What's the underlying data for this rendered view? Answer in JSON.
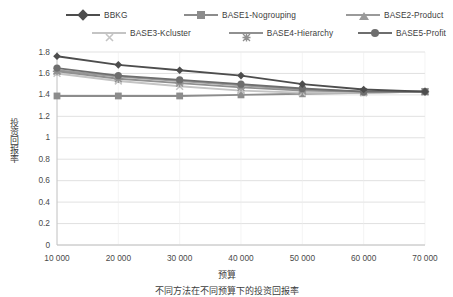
{
  "chart_data": {
    "type": "line",
    "title": "",
    "xlabel": "预算",
    "ylabel": "投资回报率",
    "categories": [
      "10 000",
      "20 000",
      "30 000",
      "40 000",
      "50 000",
      "60 000",
      "70 000"
    ],
    "x_numeric": [
      10000,
      20000,
      30000,
      40000,
      50000,
      60000,
      70000
    ],
    "ylim": [
      0,
      1.8
    ],
    "ytick_labels": [
      "0",
      "0.2",
      "0.4",
      "0.6",
      "0.8",
      "1",
      "1.2",
      "1.4",
      "1.6",
      "1.8"
    ],
    "ytick_values": [
      0,
      0.2,
      0.4,
      0.6,
      0.8,
      1.0,
      1.2,
      1.4,
      1.6,
      1.8
    ],
    "ystep": 0.2,
    "grid": "horizontal",
    "legend_position": "top",
    "series": [
      {
        "name": "BBKG",
        "marker": "diamond",
        "color": "#4d4d4d",
        "values": [
          1.76,
          1.68,
          1.63,
          1.58,
          1.5,
          1.45,
          1.43
        ]
      },
      {
        "name": "BASE1-Nogrouping",
        "marker": "square",
        "color": "#8c8c8c",
        "values": [
          1.39,
          1.39,
          1.39,
          1.4,
          1.41,
          1.42,
          1.43
        ]
      },
      {
        "name": "BASE2-Product",
        "marker": "triangle",
        "color": "#9a9a9a",
        "values": [
          1.63,
          1.57,
          1.53,
          1.49,
          1.45,
          1.43,
          1.43
        ]
      },
      {
        "name": "BASE3-Kcluster",
        "marker": "x",
        "color": "#c4c4c4",
        "values": [
          1.6,
          1.53,
          1.48,
          1.44,
          1.42,
          1.42,
          1.43
        ]
      },
      {
        "name": "BASE4-Hierarchy",
        "marker": "star",
        "color": "#909090",
        "values": [
          1.62,
          1.55,
          1.51,
          1.47,
          1.44,
          1.43,
          1.43
        ]
      },
      {
        "name": "BASE5-Profit",
        "marker": "circle",
        "color": "#6e6e6e",
        "values": [
          1.65,
          1.58,
          1.54,
          1.5,
          1.46,
          1.43,
          1.43
        ]
      }
    ]
  },
  "legend": {
    "row1": [
      "BBKG",
      "BASE1-Nogrouping",
      "BASE2-Product"
    ],
    "row2": [
      "BASE3-Kcluster",
      "BASE4-Hierarchy",
      "BASE5-Profit"
    ]
  },
  "caption": {
    "text": "不同方法在不同预算下的投资回报率"
  },
  "colors": {
    "grid": "#d9d9d9",
    "axis": "#bfbfbf",
    "text": "#3d3d3d",
    "background": "#ffffff"
  }
}
